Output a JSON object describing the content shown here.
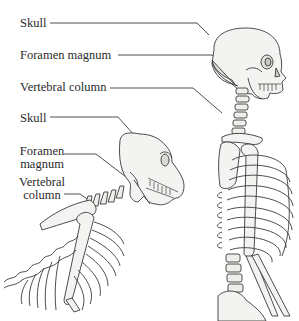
{
  "human": {
    "labels": [
      {
        "id": "skull",
        "text": "Skull"
      },
      {
        "id": "foramen",
        "text": "Foramen magnum"
      },
      {
        "id": "vertebral",
        "text": "Vertebral column"
      }
    ]
  },
  "ape": {
    "labels": [
      {
        "id": "skull",
        "text": "Skull"
      },
      {
        "id": "foramen_l1",
        "text": "Foramen"
      },
      {
        "id": "foramen_l2",
        "text": "magnum"
      },
      {
        "id": "vertebral_l1",
        "text": "Vertebral"
      },
      {
        "id": "vertebral_l2",
        "text": "column"
      }
    ]
  },
  "colors": {
    "ink": "#3a3a3a",
    "bone_fill": "#f2f2f0",
    "shade": "#d6d6d2",
    "label": "#2a2a2a"
  }
}
